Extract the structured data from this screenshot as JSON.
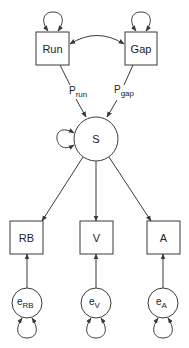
{
  "diagram": {
    "type": "path-diagram",
    "nodes": {
      "run": {
        "label": "Run",
        "shape": "square"
      },
      "gap": {
        "label": "Gap",
        "shape": "square"
      },
      "s": {
        "label": "S",
        "shape": "circle"
      },
      "rb": {
        "label": "RB",
        "shape": "square"
      },
      "v": {
        "label": "V",
        "shape": "square"
      },
      "a": {
        "label": "A",
        "shape": "square"
      },
      "e_rb": {
        "label": "e",
        "subscript": "RB",
        "shape": "circle"
      },
      "e_v": {
        "label": "e",
        "subscript": "V",
        "shape": "circle"
      },
      "e_a": {
        "label": "e",
        "subscript": "A",
        "shape": "circle"
      }
    },
    "edges": {
      "run_to_s": {
        "from": "Run",
        "to": "S",
        "label": "P",
        "label_subscript": "run"
      },
      "gap_to_s": {
        "from": "Gap",
        "to": "S",
        "label": "P",
        "label_subscript": "gap"
      },
      "run_gap_cov": {
        "from": "Run",
        "to": "Gap",
        "type": "double-headed-curve"
      },
      "s_to_rb": {
        "from": "S",
        "to": "RB"
      },
      "s_to_v": {
        "from": "S",
        "to": "V"
      },
      "s_to_a": {
        "from": "S",
        "to": "A"
      },
      "erb_to_rb": {
        "from": "eRB",
        "to": "RB"
      },
      "ev_to_v": {
        "from": "eV",
        "to": "V"
      },
      "ea_to_a": {
        "from": "eA",
        "to": "A"
      }
    },
    "self_loops": [
      "Run",
      "Gap",
      "S",
      "eRB",
      "eV",
      "eA"
    ],
    "colors": {
      "stroke": "#3a3a3a",
      "text": "#222222",
      "background": "#ffffff"
    }
  }
}
